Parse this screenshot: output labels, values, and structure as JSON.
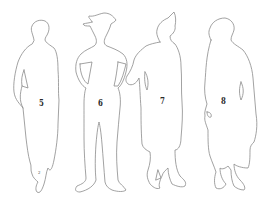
{
  "figures": [
    {
      "label": "5",
      "description": "Woman in long dress, side view"
    },
    {
      "label": "6",
      "description": "Man with wide-brim hat, hands on hips"
    },
    {
      "label": "7",
      "description": "Woman in long coat, arm extended"
    },
    {
      "label": "8",
      "description": "Woman in long coat with cloche hat"
    }
  ],
  "small_mark": "2",
  "colors": {
    "background": "#ffffff",
    "outline": "#8a8a8a",
    "label": "#2a2a2a"
  }
}
